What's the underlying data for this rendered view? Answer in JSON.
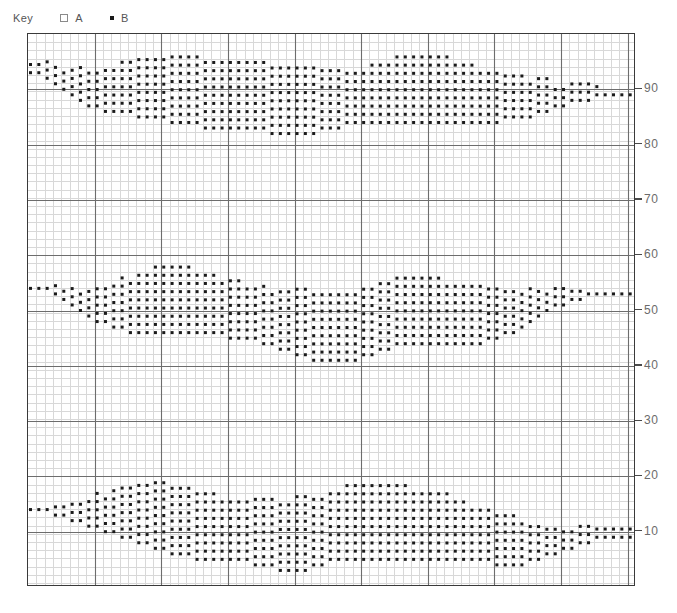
{
  "legend": {
    "title": "Key",
    "entries": [
      {
        "marker": "open-square",
        "label": "A"
      },
      {
        "marker": "filled-dot",
        "label": "B"
      }
    ]
  },
  "axis": {
    "y_ticks": [
      90,
      80,
      70,
      60,
      50,
      40,
      30,
      20,
      10
    ],
    "y_tick_labels": [
      "90",
      "80",
      "70",
      "60",
      "50",
      "40",
      "30",
      "20",
      "10"
    ],
    "y_position": "right"
  },
  "colors": {
    "dot": "#1a1a1a",
    "frame": "#3a3a3a",
    "major_grid": "#6d6d6d",
    "minor_grid": "#d8d8d8",
    "tick_label": "#6b6b6b",
    "legend_text": "#555555",
    "background": "#ffffff"
  },
  "chart_data": {
    "type": "scatter",
    "title": "",
    "xlabel": "",
    "ylabel": "",
    "xlim": [
      0,
      73
    ],
    "ylim": [
      0,
      100
    ],
    "grid": true,
    "minor_grid": true,
    "legend_position": "top-left",
    "marker_style": "filled-square-dot",
    "series": [
      {
        "name": "A",
        "marker": "open-square",
        "values": []
      },
      {
        "name": "B",
        "marker": "filled-dot",
        "values": []
      }
    ],
    "bands": [
      {
        "name": "band-top",
        "center": 90,
        "x_start": 0.3,
        "x_step": 1.0,
        "lower": [
          93,
          93,
          92,
          91,
          90,
          89,
          88,
          87,
          87,
          86,
          86,
          86,
          86,
          85,
          85,
          85,
          85,
          84,
          84,
          84,
          84,
          83,
          83,
          83,
          83,
          83,
          83,
          83,
          83,
          82,
          82,
          82,
          82,
          82,
          82,
          83,
          83,
          83,
          84,
          84,
          84,
          84,
          84,
          84,
          84,
          84,
          84,
          84,
          84,
          84,
          84,
          84,
          84,
          84,
          84,
          84,
          84,
          85,
          85,
          85,
          85,
          86,
          86,
          87,
          87,
          88,
          88,
          88,
          89,
          89,
          89,
          89,
          89
        ],
        "upper": [
          95,
          95,
          95,
          95,
          94,
          94,
          94,
          94,
          94,
          94,
          94,
          95,
          95,
          96,
          96,
          96,
          96,
          96,
          96,
          96,
          96,
          96,
          96,
          96,
          96,
          96,
          96,
          95,
          95,
          95,
          94,
          94,
          94,
          94,
          94,
          94,
          94,
          94,
          94,
          94,
          94,
          95,
          95,
          95,
          96,
          96,
          96,
          96,
          96,
          96,
          96,
          95,
          95,
          95,
          94,
          94,
          94,
          93,
          93,
          93,
          92,
          92,
          92,
          91,
          91,
          91,
          91,
          91,
          91,
          90,
          90,
          90,
          90
        ]
      },
      {
        "name": "band-middle",
        "center": 50,
        "x_start": 0.3,
        "x_step": 1.0,
        "lower": [
          54,
          54,
          54,
          53,
          52,
          51,
          50,
          49,
          48,
          48,
          47,
          47,
          46,
          46,
          46,
          46,
          46,
          46,
          46,
          46,
          46,
          46,
          46,
          46,
          45,
          45,
          45,
          45,
          44,
          44,
          43,
          43,
          42,
          42,
          41,
          41,
          41,
          41,
          41,
          41,
          42,
          42,
          43,
          43,
          44,
          44,
          44,
          44,
          44,
          44,
          44,
          44,
          44,
          44,
          44,
          45,
          45,
          46,
          46,
          47,
          48,
          49,
          50,
          51,
          51,
          52,
          52,
          53,
          53,
          53,
          53,
          53,
          53
        ],
        "upper": [
          55,
          55,
          55,
          55,
          54,
          54,
          54,
          54,
          54,
          55,
          55,
          56,
          56,
          57,
          57,
          58,
          58,
          58,
          58,
          58,
          57,
          57,
          57,
          56,
          56,
          56,
          55,
          55,
          55,
          54,
          54,
          54,
          54,
          54,
          54,
          54,
          54,
          54,
          54,
          54,
          55,
          55,
          55,
          56,
          56,
          56,
          56,
          56,
          56,
          56,
          55,
          55,
          55,
          55,
          55,
          55,
          54,
          54,
          54,
          54,
          54,
          54,
          54,
          54,
          54,
          54,
          54,
          54,
          54,
          54,
          54,
          54,
          54
        ]
      },
      {
        "name": "band-bottom",
        "center": 12,
        "x_start": 0.3,
        "x_step": 1.0,
        "lower": [
          14,
          14,
          14,
          13,
          13,
          12,
          12,
          11,
          11,
          10,
          10,
          9,
          9,
          8,
          8,
          7,
          7,
          6,
          6,
          6,
          5,
          5,
          5,
          5,
          5,
          5,
          5,
          4,
          4,
          4,
          3,
          3,
          3,
          3,
          4,
          4,
          5,
          5,
          5,
          5,
          5,
          5,
          5,
          5,
          5,
          5,
          5,
          5,
          5,
          5,
          5,
          5,
          5,
          5,
          5,
          5,
          4,
          4,
          4,
          4,
          5,
          5,
          6,
          6,
          7,
          7,
          8,
          8,
          9,
          9,
          9,
          9,
          9
        ],
        "upper": [
          15,
          15,
          15,
          15,
          15,
          15,
          16,
          16,
          17,
          17,
          18,
          18,
          19,
          19,
          19,
          19,
          19,
          19,
          18,
          18,
          18,
          17,
          17,
          16,
          16,
          16,
          16,
          16,
          16,
          16,
          16,
          16,
          17,
          17,
          17,
          17,
          18,
          18,
          19,
          19,
          19,
          19,
          19,
          19,
          19,
          19,
          18,
          18,
          18,
          17,
          17,
          16,
          16,
          15,
          15,
          14,
          14,
          13,
          13,
          12,
          12,
          11,
          11,
          11,
          11,
          11,
          11,
          11,
          11,
          11,
          11,
          11,
          11
        ]
      }
    ]
  }
}
